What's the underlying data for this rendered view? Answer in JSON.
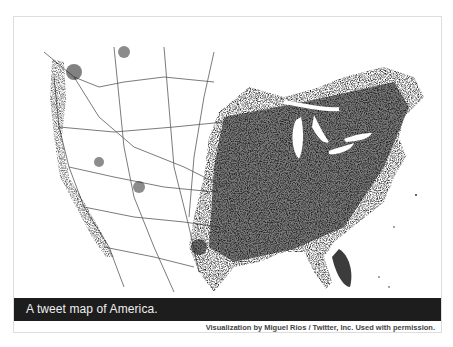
{
  "figure": {
    "title": "A tweet map of America.",
    "credit": "Visualization by Miguel Rios / Twitter, Inc. Used with permission.",
    "colors": {
      "caption_bar": "#1d1d1d",
      "caption_text": "#eeeeee",
      "map_ink": "#1a1a1a",
      "background": "#ffffff"
    }
  },
  "map": {
    "subject": "Contiguous United States",
    "encoding": "geotagged tweet density (dark = more tweets)",
    "features": [
      "Great Lakes (white)",
      "Florida peninsula",
      "dense eastern half",
      "sparse western interior"
    ]
  }
}
